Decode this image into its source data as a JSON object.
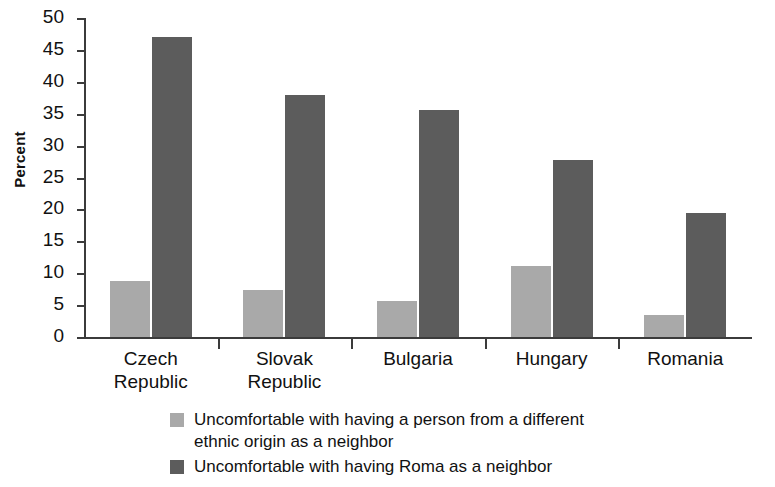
{
  "chart_data": {
    "type": "bar",
    "title": "",
    "xlabel": "",
    "ylabel": "Percent",
    "ylim": [
      0,
      50
    ],
    "ytick_values": [
      0,
      5,
      10,
      15,
      20,
      25,
      30,
      35,
      40,
      45,
      50
    ],
    "ytick_labels": [
      "0",
      "5",
      "10",
      "15",
      "20",
      "25",
      "30",
      "35",
      "40",
      "45",
      "50"
    ],
    "grid": false,
    "legend_position": "bottom",
    "categories": [
      "Czech\nRepublic",
      "Slovak\nRepublic",
      "Bulgaria",
      "Hungary",
      "Romania"
    ],
    "series": [
      {
        "name": "Uncomfortable with having a person from a different ethnic origin as a neighbor",
        "color": "#a9a9a9",
        "values": [
          8.8,
          7.3,
          5.6,
          11.1,
          3.5
        ]
      },
      {
        "name": "Uncomfortable with having Roma as a neighbor",
        "color": "#5c5c5c",
        "values": [
          47.0,
          37.9,
          35.6,
          27.7,
          19.5
        ]
      }
    ]
  },
  "legend": {
    "items": [
      {
        "swatch": "light",
        "line1": "Uncomfortable with having a person from a different",
        "line2": "ethnic origin as a neighbor"
      },
      {
        "swatch": "dark",
        "line1": "Uncomfortable with having Roma as a neighbor",
        "line2": ""
      }
    ]
  },
  "axis": {
    "y_title": "Percent"
  }
}
